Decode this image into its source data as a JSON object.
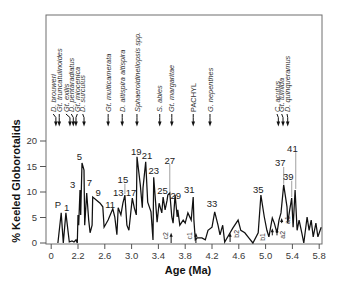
{
  "chart_data": {
    "type": "line",
    "title": "",
    "xlabel": "Age (Ma)",
    "ylabel": "% Keeled Globorotalids",
    "x_tick_labels": [
      "0",
      "2.2",
      "2.6",
      "3.0",
      "3.4",
      "3.8",
      "4.2",
      "4.6",
      "5.0",
      "5.4",
      "5.8"
    ],
    "y_ticks": [
      0,
      5,
      10,
      15,
      20
    ],
    "y_tick_labels": [
      "0",
      "5",
      "10",
      "15",
      "20"
    ],
    "xlim": [
      1.74,
      5.84
    ],
    "ylim": [
      0,
      44.7
    ],
    "grid": false,
    "legend": null,
    "series": [
      {
        "name": "% Keeled Globorotalids",
        "x": [
          1.9,
          1.95,
          1.98,
          1.99,
          2.02,
          2.07,
          2.11,
          2.14,
          2.17,
          2.19,
          2.2,
          2.21,
          2.23,
          2.24,
          2.26,
          2.29,
          2.3,
          2.33,
          2.36,
          2.38,
          2.41,
          2.42,
          2.53,
          2.57,
          2.59,
          2.65,
          2.72,
          2.75,
          2.78,
          2.8,
          2.84,
          2.87,
          2.9,
          2.93,
          2.96,
          3.01,
          3.04,
          3.07,
          3.08,
          3.13,
          3.16,
          3.17,
          3.21,
          3.24,
          3.29,
          3.32,
          3.33,
          3.38,
          3.41,
          3.45,
          3.47,
          3.5,
          3.53,
          3.54,
          3.57,
          3.6,
          3.62,
          3.65,
          3.68,
          3.69,
          3.72,
          3.77,
          3.8,
          3.84,
          3.89,
          3.92,
          3.93,
          3.95,
          3.98,
          4.05,
          4.1,
          4.14,
          4.2,
          4.24,
          4.29,
          4.32,
          4.36,
          4.39,
          4.47,
          4.51,
          4.59,
          4.63,
          4.69,
          4.75,
          4.81,
          4.89,
          4.93,
          4.98,
          5.02,
          5.05,
          5.1,
          5.13,
          5.17,
          5.2,
          5.23,
          5.27,
          5.32,
          5.33,
          5.36,
          5.39,
          5.41,
          5.44,
          5.47,
          5.5,
          5.54,
          5.57,
          5.62,
          5.65,
          5.68,
          5.71,
          5.75,
          5.78,
          5.83
        ],
        "y": [
          0,
          5.9,
          0,
          1.4,
          5.9,
          0.2,
          0.4,
          0.2,
          0.6,
          0,
          5.5,
          3.5,
          10.4,
          5.5,
          15.7,
          14.3,
          3.5,
          9.8,
          4.5,
          2.0,
          3.5,
          9.0,
          7.8,
          7.1,
          3.1,
          4.5,
          6.7,
          5.1,
          1.6,
          6.9,
          5.5,
          7.8,
          9.4,
          3.5,
          2.5,
          8.8,
          6.9,
          5.5,
          16.9,
          11.4,
          6.9,
          10.8,
          15.9,
          8.0,
          6.1,
          0.6,
          12.9,
          4.1,
          7.8,
          5.9,
          9.0,
          6.5,
          8.4,
          9.4,
          9.8,
          5.1,
          3.9,
          9.4,
          5.1,
          6.5,
          3.5,
          4.5,
          3.9,
          5.9,
          4.5,
          9.0,
          4.5,
          0.6,
          1.0,
          1.0,
          0.6,
          2.5,
          3.1,
          6.1,
          3.5,
          1.6,
          3.5,
          0.2,
          2.0,
          2.9,
          4.5,
          2.5,
          2.0,
          1.0,
          0,
          2.0,
          9.4,
          5.1,
          2.5,
          1.2,
          4.9,
          3.9,
          2.0,
          4.5,
          5.9,
          11.4,
          7.1,
          3.9,
          6.5,
          8.8,
          3.1,
          10.4,
          2.5,
          4.5,
          2.0,
          0,
          5.1,
          2.5,
          4.5,
          1.2,
          3.9,
          1.2,
          3.1
        ]
      }
    ],
    "sample_labels": [
      {
        "label": "P",
        "x": 1.9,
        "y": 7.5
      },
      {
        "label": "1",
        "x": 2.03,
        "y": 6.9
      },
      {
        "label": "3",
        "x": 2.12,
        "y": 11.4
      },
      {
        "label": "5",
        "x": 2.22,
        "y": 16.9
      },
      {
        "label": "7",
        "x": 2.37,
        "y": 11.8
      },
      {
        "label": "9",
        "x": 2.5,
        "y": 9.8
      },
      {
        "label": "11",
        "x": 2.68,
        "y": 7.6
      },
      {
        "label": "13",
        "x": 2.8,
        "y": 9.8
      },
      {
        "label": "15",
        "x": 2.87,
        "y": 12.4,
        "leader": {
          "x": 2.9,
          "y": [
            11.6,
            9.6
          ]
        }
      },
      {
        "label": "17",
        "x": 2.99,
        "y": 9.8
      },
      {
        "label": "19",
        "x": 3.07,
        "y": 18.0
      },
      {
        "label": "21",
        "x": 3.23,
        "y": 17.1
      },
      {
        "label": "23",
        "x": 3.33,
        "y": 14.1
      },
      {
        "label": "25",
        "x": 3.46,
        "y": 10.2
      },
      {
        "label": "27",
        "x": 3.57,
        "y": 16.1,
        "leader": {
          "x": 3.57,
          "y": [
            15.5,
            10.0
          ]
        }
      },
      {
        "label": "29",
        "x": 3.66,
        "y": 9.2
      },
      {
        "label": "31",
        "x": 3.86,
        "y": 10.4
      },
      {
        "label": "33",
        "x": 4.2,
        "y": 7.8
      },
      {
        "label": "35",
        "x": 4.89,
        "y": 10.4
      },
      {
        "label": "37",
        "x": 5.22,
        "y": 15.7,
        "leader": {
          "x": 5.27,
          "y": [
            14.9,
            11.6
          ]
        }
      },
      {
        "label": "39",
        "x": 5.34,
        "y": 13.0,
        "leader": {
          "x": 5.39,
          "y": [
            12.2,
            9.0
          ]
        }
      },
      {
        "label": "41",
        "x": 5.4,
        "y": 18.6,
        "leader": {
          "x": 5.45,
          "y": [
            17.8,
            10.6
          ]
        }
      }
    ],
    "events": [
      {
        "label": "D. brouweri",
        "label_x": 1.83,
        "x": 1.87,
        "italic": true
      },
      {
        "label": "Gt. truncatulinoides",
        "label_x": 1.92,
        "x": 1.92,
        "italic": true
      },
      {
        "label": "Gt. exilis",
        "label_x": 2.02,
        "x": 2.08,
        "italic": true
      },
      {
        "label": "D. pentaradiatus",
        "label_x": 2.1,
        "x": 2.13,
        "italic": true
      },
      {
        "label": "Gt. miocenica",
        "label_x": 2.19,
        "x": 2.17,
        "italic": true
      },
      {
        "label": "D. surculus",
        "label_x": 2.27,
        "x": 2.29,
        "italic": true
      },
      {
        "label": "Gt. multicamerata",
        "label_x": 2.65,
        "x": 2.65,
        "italic": true
      },
      {
        "label": "D. altispira altispira",
        "label_x": 2.86,
        "x": 2.86,
        "italic": true
      },
      {
        "label": "Sphaeroidinellopsis spp.",
        "label_x": 3.08,
        "x": 3.08,
        "italic": true
      },
      {
        "label": "S. abies",
        "label_x": 3.42,
        "x": 3.42,
        "italic": true
      },
      {
        "label": "Gt. margaritae",
        "label_x": 3.6,
        "x": 3.6,
        "italic": true
      },
      {
        "label": "PACHYL",
        "label_x": 3.92,
        "x": 3.92,
        "italic": false
      },
      {
        "label": "G. nepenthes",
        "label_x": 4.17,
        "x": 4.17,
        "italic": true
      },
      {
        "label": "C. acutus",
        "label_x": 5.17,
        "x": 5.19,
        "italic": true
      },
      {
        "label": "Gt. tumida",
        "label_x": 5.24,
        "x": 5.26,
        "italic": true
      },
      {
        "label": "D. quinqueramus",
        "label_x": 5.32,
        "x": 5.33,
        "italic": true
      }
    ],
    "markers": [
      {
        "label": "c2",
        "x": 3.51,
        "y": 1.4,
        "arrows": [
          [
            3.59,
            0.0,
            2.0
          ]
        ]
      },
      {
        "label": "c1",
        "x": 3.87,
        "y": 1.4,
        "arrows": [
          [
            3.96,
            0.0,
            2.0
          ]
        ]
      },
      {
        "label": "b2",
        "x": 4.56,
        "y": 1.8,
        "arrows": [
          [
            4.47,
            0.2,
            2.0
          ]
        ]
      },
      {
        "label": "b1",
        "x": 4.96,
        "y": 1.2,
        "arrows": [
          [
            5.1,
            1.5,
            2.9
          ],
          [
            5.17,
            1.5,
            2.9
          ]
        ]
      },
      {
        "label": "a2",
        "x": 5.26,
        "y": 1.6,
        "arrows": []
      },
      {
        "label": "a1",
        "x": 5.33,
        "y": 4.5,
        "arrows": [
          [
            5.24,
            3.9,
            4.9
          ]
        ]
      }
    ]
  }
}
